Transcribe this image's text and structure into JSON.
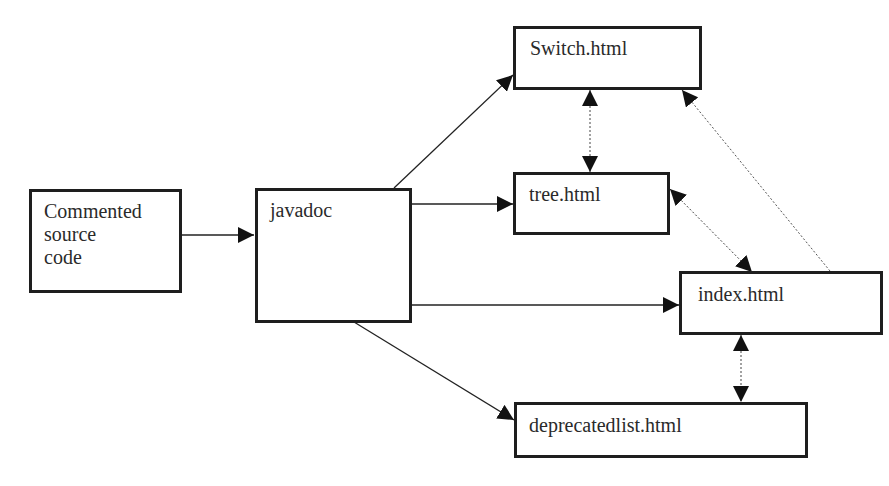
{
  "diagram": {
    "type": "flow",
    "nodes": [
      {
        "id": "source",
        "label": "Commented\nsource\ncode"
      },
      {
        "id": "javadoc",
        "label": "javadoc"
      },
      {
        "id": "switch",
        "label": "Switch.html"
      },
      {
        "id": "tree",
        "label": "tree.html"
      },
      {
        "id": "index",
        "label": "index.html"
      },
      {
        "id": "deprecated",
        "label": "deprecatedlist.html"
      }
    ],
    "edges": [
      {
        "from": "source",
        "to": "javadoc",
        "style": "solid",
        "direction": "forward"
      },
      {
        "from": "javadoc",
        "to": "switch",
        "style": "solid",
        "direction": "forward"
      },
      {
        "from": "javadoc",
        "to": "tree",
        "style": "solid",
        "direction": "forward"
      },
      {
        "from": "javadoc",
        "to": "index",
        "style": "solid",
        "direction": "forward"
      },
      {
        "from": "javadoc",
        "to": "deprecated",
        "style": "solid",
        "direction": "forward"
      },
      {
        "from": "switch",
        "to": "tree",
        "style": "dotted",
        "direction": "both"
      },
      {
        "from": "tree",
        "to": "index",
        "style": "dotted",
        "direction": "both"
      },
      {
        "from": "index",
        "to": "switch",
        "style": "dotted",
        "direction": "forward"
      },
      {
        "from": "index",
        "to": "deprecated",
        "style": "dotted",
        "direction": "both"
      }
    ]
  }
}
